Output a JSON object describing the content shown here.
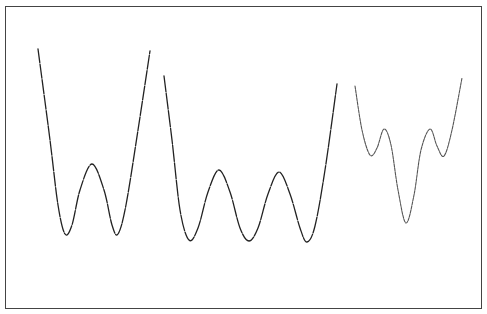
{
  "chart_data": {
    "type": "line",
    "title": "",
    "xlabel": "",
    "ylabel": "",
    "grid": false,
    "legend": null,
    "series": [
      {
        "name": "double-well",
        "points": [
          [
            38,
            49
          ],
          [
            50,
            140
          ],
          [
            58,
            205
          ],
          [
            65,
            234
          ],
          [
            72,
            225
          ],
          [
            80,
            190
          ],
          [
            92,
            164
          ],
          [
            104,
            190
          ],
          [
            112,
            225
          ],
          [
            118,
            234
          ],
          [
            126,
            205
          ],
          [
            138,
            130
          ],
          [
            150,
            51
          ]
        ]
      },
      {
        "name": "triple-well",
        "points": [
          [
            164,
            76
          ],
          [
            172,
            140
          ],
          [
            180,
            210
          ],
          [
            189,
            240
          ],
          [
            198,
            228
          ],
          [
            208,
            192
          ],
          [
            219,
            170
          ],
          [
            230,
            192
          ],
          [
            240,
            228
          ],
          [
            249,
            241
          ],
          [
            258,
            228
          ],
          [
            268,
            194
          ],
          [
            279,
            172
          ],
          [
            290,
            194
          ],
          [
            300,
            228
          ],
          [
            307,
            242
          ],
          [
            315,
            226
          ],
          [
            325,
            170
          ],
          [
            337,
            84
          ]
        ]
      },
      {
        "name": "central-deep-well",
        "points": [
          [
            355,
            86
          ],
          [
            362,
            130
          ],
          [
            370,
            155
          ],
          [
            377,
            148
          ],
          [
            384,
            129
          ],
          [
            391,
            145
          ],
          [
            398,
            190
          ],
          [
            406,
            223
          ],
          [
            414,
            195
          ],
          [
            421,
            150
          ],
          [
            430,
            129
          ],
          [
            437,
            146
          ],
          [
            444,
            156
          ],
          [
            452,
            130
          ],
          [
            462,
            78
          ]
        ]
      }
    ],
    "frame": {
      "left": 5,
      "top": 6,
      "right": 483,
      "bottom": 310
    }
  }
}
